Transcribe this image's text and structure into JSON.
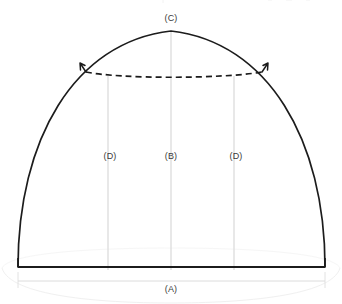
{
  "diagram": {
    "type": "arch-dimension-drawing",
    "background_color": "#ffffff",
    "outline_color": "#1a1a1a",
    "guide_color": "#d8d8d8",
    "faint_color": "#eeeeee",
    "label_color": "#3a3a3a",
    "labels": {
      "span_bottom": "(A)",
      "height_center": "(B)",
      "rise_top": "(C)",
      "height_left": "(D)",
      "height_right": "(D)"
    },
    "geometry": {
      "baseline_y": 267,
      "left_springing_x": 18,
      "right_springing_x": 325,
      "apex_x": 171,
      "apex_y": 31,
      "guide_lines_x": [
        108,
        171,
        234
      ],
      "dashed_arc_left_x": 85,
      "dashed_arc_right_x": 263,
      "dashed_arc_y": 74,
      "dimension_line_y": 281
    },
    "label_positions": {
      "span_bottom": {
        "x": 171,
        "y": 285
      },
      "height_center": {
        "x": 171,
        "y": 152
      },
      "rise_top": {
        "x": 171,
        "y": 14
      },
      "height_left": {
        "x": 110,
        "y": 152
      },
      "height_right": {
        "x": 236,
        "y": 152
      }
    }
  }
}
